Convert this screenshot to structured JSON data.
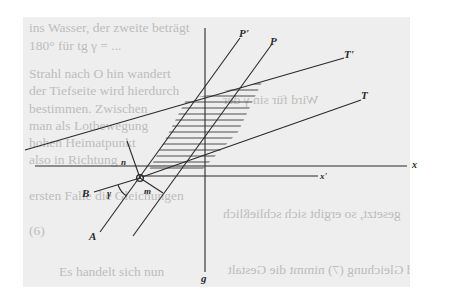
{
  "figure": {
    "labels": {
      "P_prime": "P'",
      "P": "P",
      "T_prime": "T'",
      "T": "T",
      "x": "x",
      "x_prime": "x'",
      "g": "g",
      "B": "B",
      "A": "A",
      "n": "n",
      "m": "m",
      "gamma": "γ"
    },
    "colors": {
      "page": "#eeeeee",
      "ink": "#2a2a2a",
      "bleed_text": "#bdbdbd"
    }
  },
  "bleed_through_text": {
    "lines": [
      "ins Wasser, der zweite beträgt",
      "180° für tg γ = ...",
      "Strahl nach O hin wandert",
      "der Tiefseite wird hierdurch",
      "bestimmen. Zwischen",
      "man als Lotbewegung",
      "hohen Heimatpunkt",
      "also in Richtung",
      "ersten Falle die Gleichungen",
      "(6)",
      "Es handelt sich nun"
    ],
    "mirrored_lines": [
      "Wird für sin γ der",
      "gesetzt, so ergibt sich schließlich",
      "und Gleichung (7) nimmt die Gestalt"
    ]
  }
}
